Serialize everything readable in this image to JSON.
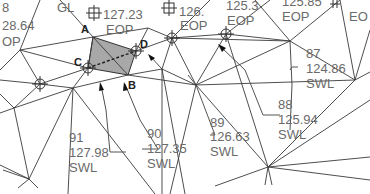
{
  "drawing": {
    "colors": {
      "background": "#ffffff",
      "lines": "#3a3a3a",
      "text": "#6a6a6a",
      "highlight_fill": "#a8a8a8",
      "point_label": "#222222"
    },
    "point_labels": {
      "A": "A",
      "B": "B",
      "C": "C",
      "D": "D"
    },
    "top_labels": [
      {
        "id": "top-left-fragment",
        "line1": "8",
        "line2": "28.64",
        "line3": "OP"
      },
      {
        "id": "gl",
        "line1": "GL"
      },
      {
        "id": "pt-127-23",
        "line1": "127.23",
        "line2": "EOP"
      },
      {
        "id": "pt-126",
        "line1": "126.",
        "line2": "EOP"
      },
      {
        "id": "pt-125-3",
        "line1": "125.3",
        "line2": "EOP"
      },
      {
        "id": "pt-125-8",
        "line1": "125.85",
        "line2": "EOP"
      },
      {
        "id": "pt-right-edge",
        "line1": "EO"
      }
    ],
    "shot_labels": [
      {
        "id": "87",
        "number": "87",
        "elevation": "124.86",
        "code": "SWL"
      },
      {
        "id": "88",
        "number": "88",
        "elevation": "125.94",
        "code": "SWL"
      },
      {
        "id": "89",
        "number": "89",
        "elevation": "126.63",
        "code": "SWL"
      },
      {
        "id": "90",
        "number": "90",
        "elevation": "127.35",
        "code": "SWL"
      },
      {
        "id": "91",
        "number": "91",
        "elevation": "127.98",
        "code": "SWL"
      }
    ]
  }
}
